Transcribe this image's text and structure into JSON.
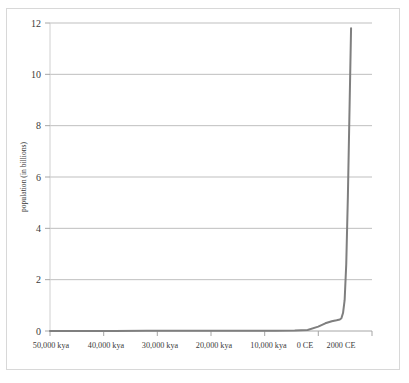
{
  "chart_data": {
    "type": "line",
    "title": "",
    "xlabel": "",
    "ylabel": "population (in billions)",
    "ylim": [
      0,
      12
    ],
    "yticks": [
      0,
      2,
      4,
      6,
      8,
      10,
      12
    ],
    "ytick_labels": [
      "0",
      "2",
      "4",
      "6",
      "8",
      "10",
      "12"
    ],
    "xtick_labels": [
      "50,000 kya",
      "40,000 kya",
      "30,000 kya",
      "20,000 kya",
      "10,000 kya",
      "0 CE",
      "2000 CE"
    ],
    "grid": "horizontal",
    "legend": "none",
    "line_color": "#7f7f7f",
    "series": [
      {
        "name": "world population",
        "x_positions": [
          0.0,
          0.1,
          0.2,
          0.3,
          0.4,
          0.5,
          0.6,
          0.7,
          0.76,
          0.8,
          0.833,
          0.855,
          0.875,
          0.89,
          0.9,
          0.905,
          0.91,
          0.915,
          0.92,
          0.925,
          0.93,
          0.935
        ],
        "values": [
          0.002,
          0.003,
          0.004,
          0.005,
          0.006,
          0.008,
          0.01,
          0.014,
          0.02,
          0.04,
          0.17,
          0.3,
          0.38,
          0.42,
          0.45,
          0.5,
          0.7,
          1.2,
          2.6,
          5.2,
          8.5,
          11.8
        ]
      }
    ],
    "annotations": []
  },
  "axis": {
    "y_axis_title": "population (in billions)",
    "y_tick_0": "0",
    "y_tick_2": "2",
    "y_tick_4": "4",
    "y_tick_6": "6",
    "y_tick_8": "8",
    "y_tick_10": "10",
    "y_tick_12": "12",
    "x_tick_1": "50,000 kya",
    "x_tick_2": "40,000 kya",
    "x_tick_3": "30,000 kya",
    "x_tick_4": "20,000 kya",
    "x_tick_5": "10,000 kya",
    "x_tick_6": "0 CE",
    "x_tick_7": "2000 CE"
  },
  "colors": {
    "line": "#7f7f7f",
    "gridline": "#bfbfbf",
    "axis": "#a6a6a6",
    "frame": "#d8d8d8",
    "background": "#ffffff"
  }
}
